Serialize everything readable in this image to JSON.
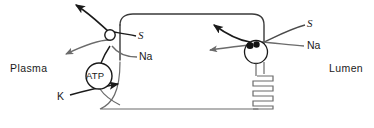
{
  "figure": {
    "type": "biological-membrane-transport-diagram",
    "title": "",
    "background_color": "#ffffff",
    "stroke_color": "#1a1a1a"
  },
  "compartments": {
    "left": {
      "label": "Plasma"
    },
    "right": {
      "label": "Lumen"
    }
  },
  "cell": {
    "description": "epithelial cell outline with rounded top corners",
    "border_color": "#555555"
  },
  "transporters": {
    "basolateral": {
      "name": "basolateral-transporter",
      "symbol": "open-circle",
      "substrate_label": "S",
      "ion_label": "Na"
    },
    "apical": {
      "name": "apical-cotransporter",
      "symbol": "open-circle-with-filled-blob",
      "substrate_label": "S",
      "ion_label": "Na"
    },
    "pump": {
      "name": "sodium-potassium-atpase",
      "label": "ATP",
      "ion_in_label": "K",
      "ion_out_label": "Na"
    }
  },
  "structures": {
    "coil": {
      "name": "coiled-tubule",
      "loops": 5
    }
  },
  "labels": {
    "s_left": "S",
    "na_left": "Na",
    "s_right": "S",
    "na_right": "Na",
    "k": "K",
    "atp": "ATP",
    "plasma": "Plasma",
    "lumen": "Lumen"
  }
}
